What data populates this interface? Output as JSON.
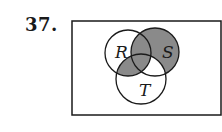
{
  "problem": {
    "number": "37."
  },
  "diagram": {
    "type": "venn-3",
    "sets": [
      {
        "name": "R",
        "cx": 128,
        "cy": 53,
        "r": 23
      },
      {
        "name": "S",
        "cx": 155,
        "cy": 52,
        "r": 24
      },
      {
        "name": "T",
        "cx": 141,
        "cy": 79,
        "r": 25
      }
    ],
    "universe": {
      "x": 72,
      "y": 21,
      "width": 149,
      "height": 94
    },
    "shaded_regions": [
      "S only",
      "R∩S only",
      "R∩S∩T",
      "R∩T only"
    ],
    "unshaded_regions": [
      "R only",
      "T only",
      "S∩T only",
      "outside"
    ],
    "shade_color": "#8a8a8a",
    "stroke_color": "#1a1a1a"
  }
}
